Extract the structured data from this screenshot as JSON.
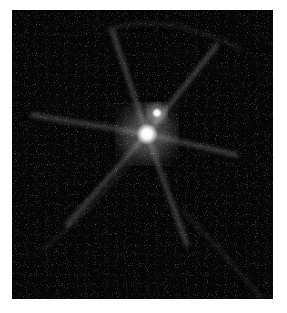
{
  "image": {
    "subject": "bright star with diffraction spikes and faint companion",
    "background_color": "#050505",
    "primary_source": {
      "cx": 135,
      "cy": 124,
      "r": 10,
      "color": "#ffffff"
    },
    "companion_source": {
      "cx": 145,
      "cy": 103,
      "r": 5,
      "color": "#e8e8e8"
    },
    "spikes": [
      {
        "x2": 100,
        "y2": 20
      },
      {
        "x2": 205,
        "y2": 35
      },
      {
        "x2": 20,
        "y2": 105
      },
      {
        "x2": 225,
        "y2": 145
      },
      {
        "x2": 55,
        "y2": 215
      },
      {
        "x2": 175,
        "y2": 235
      }
    ]
  }
}
